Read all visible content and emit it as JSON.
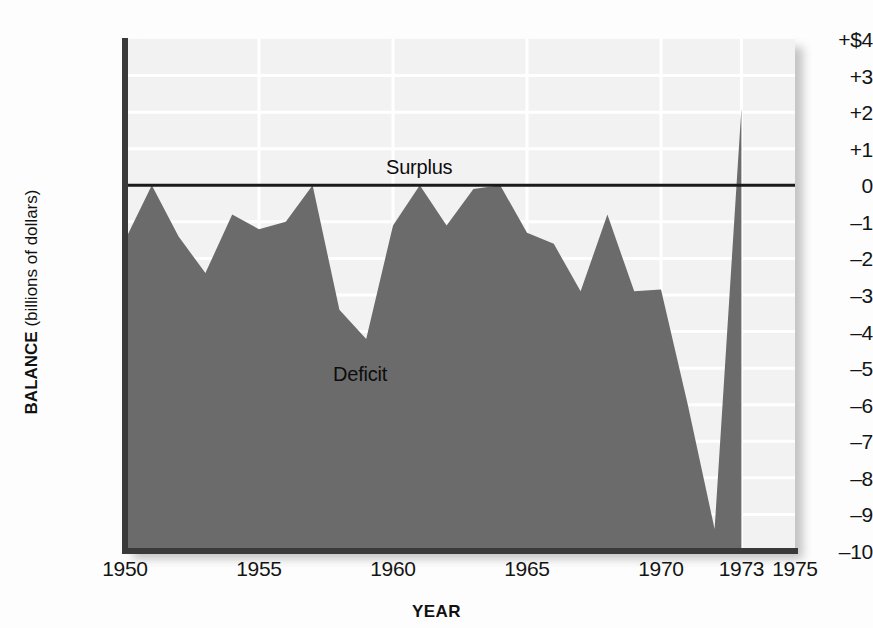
{
  "chart_data": {
    "type": "area",
    "title": "",
    "xlabel": "YEAR",
    "ylabel_bold": "BALANCE",
    "ylabel_sub": " (billions of dollars)",
    "xlim": [
      1950,
      1975
    ],
    "ylim": [
      -10,
      4
    ],
    "grid": true,
    "grid_color": "#ffffff",
    "fill_color": "#6b6b6b",
    "plot_background": "#f2f2f2",
    "zero_line_color": "#1a1a1a",
    "legend_position": "none",
    "series_name": "U.S. balance of trade",
    "y_ticks": [
      {
        "value": 4,
        "label": "+$4"
      },
      {
        "value": 3,
        "label": "+3"
      },
      {
        "value": 2,
        "label": "+2"
      },
      {
        "value": 1,
        "label": "+1"
      },
      {
        "value": 0,
        "label": "0"
      },
      {
        "value": -1,
        "label": "–1"
      },
      {
        "value": -2,
        "label": "–2"
      },
      {
        "value": -3,
        "label": "–3"
      },
      {
        "value": -4,
        "label": "–4"
      },
      {
        "value": -5,
        "label": "–5"
      },
      {
        "value": -6,
        "label": "–6"
      },
      {
        "value": -7,
        "label": "–7"
      },
      {
        "value": -8,
        "label": "–8"
      },
      {
        "value": -9,
        "label": "–9"
      },
      {
        "value": -10,
        "label": "–10"
      }
    ],
    "x_ticks": [
      {
        "value": 1950,
        "label": "1950"
      },
      {
        "value": 1955,
        "label": "1955"
      },
      {
        "value": 1960,
        "label": "1960"
      },
      {
        "value": 1965,
        "label": "1965"
      },
      {
        "value": 1970,
        "label": "1970"
      },
      {
        "value": 1973,
        "label": "1973"
      },
      {
        "value": 1975,
        "label": "1975"
      }
    ],
    "x_gridlines": [
      1955,
      1960,
      1965,
      1970,
      1973
    ],
    "x": [
      1950,
      1951,
      1952,
      1953,
      1954,
      1955,
      1956,
      1957,
      1958,
      1959,
      1960,
      1961,
      1962,
      1963,
      1964,
      1965,
      1966,
      1967,
      1968,
      1969,
      1970,
      1971,
      1972,
      1973
    ],
    "values": [
      -1.5,
      0.0,
      -1.4,
      -2.4,
      -0.8,
      -1.2,
      -1.0,
      0.0,
      -3.4,
      -4.2,
      -1.1,
      0.0,
      -1.1,
      -0.1,
      0.0,
      -1.3,
      -1.6,
      -2.9,
      -0.8,
      -2.9,
      -2.85,
      -6.0,
      -9.4,
      2.1
    ],
    "annotations": [
      {
        "id": "surplus",
        "text": "Surplus",
        "x": 1958.1,
        "y": 1.0
      },
      {
        "id": "deficit",
        "text": "Deficit",
        "x": 1956.2,
        "y": -4.8
      }
    ]
  }
}
